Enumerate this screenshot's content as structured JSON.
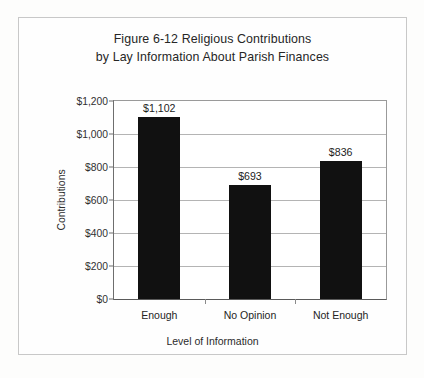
{
  "page": {
    "background_color": "#fdfdfc",
    "border_color": "#c8c8c8"
  },
  "chart_data": {
    "type": "bar",
    "title": "Figure 6-12 Religious Contributions by Lay Information About Parish Finances",
    "title_lines": [
      "Figure 6-12 Religious Contributions",
      "by Lay Information About Parish Finances"
    ],
    "categories": [
      "Enough",
      "No Opinion",
      "Not Enough"
    ],
    "values": [
      1102,
      693,
      836
    ],
    "data_labels": [
      "$1,102",
      "$693",
      "$836"
    ],
    "xlabel": "Level of Information",
    "ylabel": "Contributions",
    "ylim": [
      0,
      1200
    ],
    "ytick_values": [
      0,
      200,
      400,
      600,
      800,
      1000,
      1200
    ],
    "ytick_labels": [
      "$0",
      "$200",
      "$400",
      "$600",
      "$800",
      "$1,000",
      "$1,200"
    ],
    "grid": true,
    "grid_axis": "y",
    "legend": false,
    "bar_color": "#111111",
    "plot_background": "#ffffff"
  }
}
